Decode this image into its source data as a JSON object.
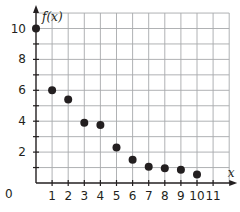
{
  "chart_data": {
    "type": "scatter",
    "title": "",
    "xlabel": "x",
    "ylabel": "f(x)",
    "xlim": [
      0,
      12
    ],
    "ylim": [
      0,
      11
    ],
    "grid": true,
    "legend": null,
    "x_ticks": [
      "1",
      "2",
      "3",
      "4",
      "5",
      "6",
      "7",
      "8",
      "9",
      "10",
      "11"
    ],
    "y_ticks": [
      "2",
      "4",
      "6",
      "8",
      "10"
    ],
    "origin_label": "0",
    "series": [
      {
        "name": "f(x)",
        "x": [
          0,
          1,
          2,
          3,
          4,
          5,
          6,
          7,
          8,
          9,
          10
        ],
        "y": [
          10,
          6,
          5.4,
          3.9,
          3.75,
          2.3,
          1.5,
          1.05,
          0.95,
          0.85,
          0.55
        ]
      }
    ]
  },
  "colors": {
    "grid": "#a7a9ac",
    "axis": "#231f20",
    "point": "#231f20"
  }
}
